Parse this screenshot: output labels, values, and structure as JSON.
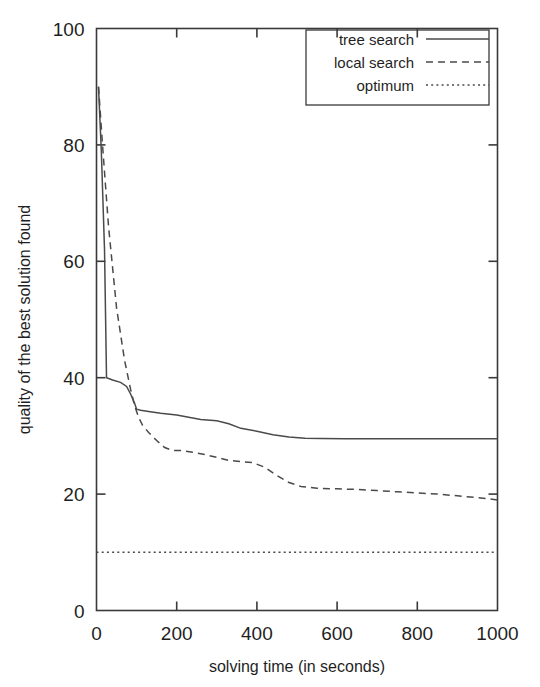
{
  "chart_data": {
    "type": "line",
    "title": "",
    "xlabel": "solving time (in seconds)",
    "ylabel": "quality of the best solution found",
    "xlim": [
      0,
      1000
    ],
    "ylim": [
      0,
      100
    ],
    "xticks": [
      0,
      200,
      400,
      600,
      800,
      1000
    ],
    "yticks": [
      0,
      20,
      40,
      60,
      80,
      100
    ],
    "xtick_labels": [
      "0",
      "200",
      "400",
      "600",
      "800",
      "1000"
    ],
    "ytick_labels": [
      "0",
      "20",
      "40",
      "60",
      "80",
      "100"
    ],
    "grid": false,
    "legend_position": "top-right",
    "series": [
      {
        "name": "tree search",
        "style": "solid",
        "color": "#4a4a4a",
        "x": [
          5,
          12,
          20,
          25,
          40,
          60,
          75,
          85,
          95,
          100,
          110,
          130,
          160,
          200,
          230,
          260,
          300,
          330,
          360,
          400,
          440,
          480,
          520,
          560,
          620,
          700,
          800,
          900,
          1000
        ],
        "y": [
          90,
          79,
          62,
          40,
          39.6,
          39.2,
          38.5,
          37.2,
          35.6,
          34.6,
          34.4,
          34.2,
          33.9,
          33.6,
          33.2,
          32.8,
          32.6,
          32.1,
          31.3,
          30.8,
          30.2,
          29.8,
          29.6,
          29.55,
          29.5,
          29.5,
          29.5,
          29.5,
          29.5
        ]
      },
      {
        "name": "local search",
        "style": "dashed",
        "color": "#4a4a4a",
        "x": [
          5,
          15,
          30,
          50,
          70,
          85,
          95,
          105,
          115,
          130,
          150,
          170,
          190,
          210,
          240,
          270,
          300,
          330,
          360,
          390,
          420,
          450,
          480,
          510,
          550,
          600,
          650,
          700,
          750,
          800,
          850,
          900,
          950,
          1000
        ],
        "y": [
          90,
          80,
          66,
          52,
          43,
          38,
          35.2,
          33.2,
          31.8,
          30.6,
          29.2,
          28.0,
          27.5,
          27.5,
          27.2,
          26.8,
          26.3,
          25.8,
          25.6,
          25.4,
          24.6,
          23.2,
          22.0,
          21.3,
          21.0,
          20.9,
          20.8,
          20.6,
          20.4,
          20.2,
          20.0,
          19.7,
          19.4,
          19.0
        ]
      },
      {
        "name": "optimum",
        "style": "dotted",
        "color": "#6a6a6a",
        "x": [
          0,
          1000
        ],
        "y": [
          10,
          10
        ]
      }
    ]
  },
  "legend": {
    "entries": [
      {
        "label": "tree search",
        "style": "solid"
      },
      {
        "label": "local search",
        "style": "dashed"
      },
      {
        "label": "optimum",
        "style": "dotted"
      }
    ]
  }
}
